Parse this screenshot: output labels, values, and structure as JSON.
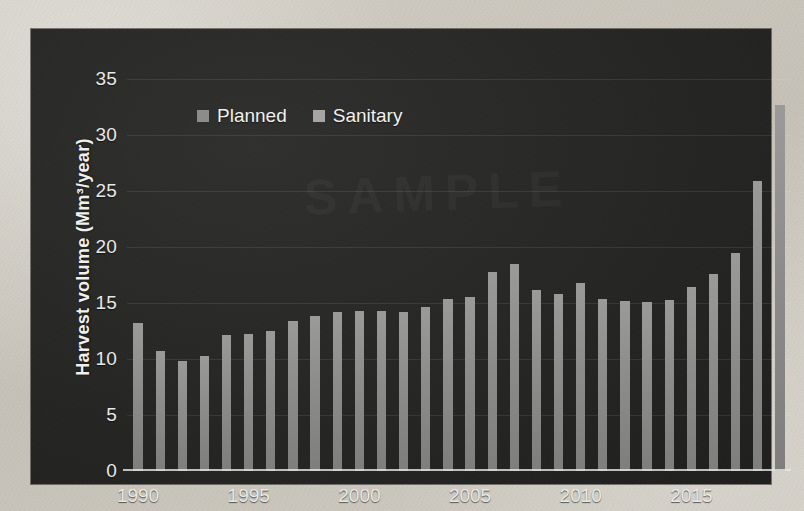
{
  "chart_data": {
    "type": "bar",
    "title": "",
    "xlabel": "",
    "ylabel": "Harvest volume  (Mm³/year)",
    "ylim": [
      0,
      35
    ],
    "ytick_step": 5,
    "yticks": [
      "0",
      "5",
      "10",
      "15",
      "20",
      "25",
      "30",
      "35"
    ],
    "xticks": [
      "1990",
      "1995",
      "2000",
      "2005",
      "2010",
      "2015"
    ],
    "grid": true,
    "legend_position": "top-left",
    "legend": [
      "Planned",
      "Sanitary"
    ],
    "categories": [
      "1990",
      "1991",
      "1992",
      "1993",
      "1994",
      "1995",
      "1996",
      "1997",
      "1998",
      "1999",
      "2000",
      "2001",
      "2002",
      "2003",
      "2004",
      "2005",
      "2006",
      "2007",
      "2008",
      "2009",
      "2010",
      "2011",
      "2012",
      "2013",
      "2014",
      "2015",
      "2016",
      "2017",
      "2018",
      "2019"
    ],
    "series": [
      {
        "name": "Planned",
        "values": [
          13.2,
          10.7,
          9.8,
          10.3,
          12.1,
          12.2,
          12.5,
          13.4,
          13.8,
          14.2,
          14.3,
          14.3,
          14.2,
          14.6,
          15.4,
          15.5,
          17.8,
          18.5,
          16.2,
          15.8,
          16.8,
          15.4,
          15.2,
          15.1,
          15.3,
          16.4,
          17.6,
          19.5,
          25.9,
          32.7
        ]
      },
      {
        "name": "Sanitary",
        "values": [
          0,
          0,
          0,
          0,
          0,
          0,
          0,
          0,
          0,
          0,
          0,
          0,
          0,
          0,
          0,
          0,
          0,
          0,
          0,
          0,
          0,
          0,
          0,
          0,
          0,
          0,
          0,
          0,
          0,
          0
        ]
      }
    ],
    "colors": {
      "planned_bar": "#8c8c8a",
      "sanitary_bar": "#a5a5a3",
      "panel_background": "#262625",
      "axis_text": "#e9e9e7",
      "gridline": "#3d3d3c"
    }
  },
  "watermark": {
    "text": "SAMPLE"
  }
}
